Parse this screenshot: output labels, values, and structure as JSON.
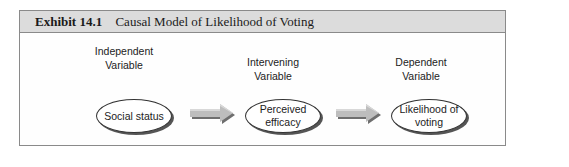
{
  "exhibit": {
    "number": "Exhibit 14.1",
    "title": "Causal Model of Likelihood of Voting"
  },
  "diagram": {
    "nodes": [
      {
        "role_line1": "Independent",
        "role_line2": "Variable",
        "text_line1": "Social status",
        "text_line2": ""
      },
      {
        "role_line1": "Intervening",
        "role_line2": "Variable",
        "text_line1": "Perceived",
        "text_line2": "efficacy"
      },
      {
        "role_line1": "Dependent",
        "role_line2": "Variable",
        "text_line1": "Likelihood of",
        "text_line2": "voting"
      }
    ],
    "edges": [
      {
        "from": "Social status",
        "to": "Perceived efficacy"
      },
      {
        "from": "Perceived efficacy",
        "to": "Likelihood of voting"
      }
    ],
    "colors": {
      "header_bg": "#dcdcdc",
      "frame": "#8a8a8a",
      "arrow_fill": "#bdbdbd",
      "arrow_shadow": "#6e6e6e"
    }
  }
}
